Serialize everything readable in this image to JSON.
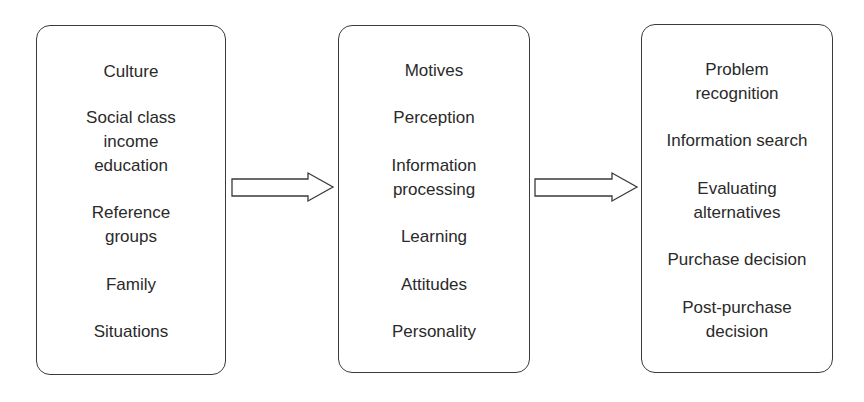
{
  "diagram": {
    "boxes": [
      {
        "id": "influences",
        "items": [
          {
            "lines": [
              "Culture"
            ]
          },
          {
            "lines": [
              "Social class",
              "income",
              "education"
            ]
          },
          {
            "lines": [
              "Reference",
              "groups"
            ]
          },
          {
            "lines": [
              "Family"
            ]
          },
          {
            "lines": [
              "Situations"
            ]
          }
        ]
      },
      {
        "id": "psychological",
        "items": [
          {
            "lines": [
              "Motives"
            ]
          },
          {
            "lines": [
              "Perception"
            ]
          },
          {
            "lines": [
              "Information",
              "processing"
            ]
          },
          {
            "lines": [
              "Learning"
            ]
          },
          {
            "lines": [
              "Attitudes"
            ]
          },
          {
            "lines": [
              "Personality"
            ]
          }
        ]
      },
      {
        "id": "decision-process",
        "items": [
          {
            "lines": [
              "Problem",
              "recognition"
            ]
          },
          {
            "lines": [
              "Information search"
            ]
          },
          {
            "lines": [
              "Evaluating",
              "alternatives"
            ]
          },
          {
            "lines": [
              "Purchase decision"
            ]
          },
          {
            "lines": [
              "Post-purchase",
              "decision"
            ]
          }
        ]
      }
    ],
    "arrows": [
      {
        "from": "influences",
        "to": "psychological",
        "icon": "right-arrow-icon"
      },
      {
        "from": "psychological",
        "to": "decision-process",
        "icon": "right-arrow-icon"
      }
    ],
    "colors": {
      "stroke": "#3a3a3a",
      "text": "#2a2a2a",
      "background": "#ffffff"
    }
  }
}
